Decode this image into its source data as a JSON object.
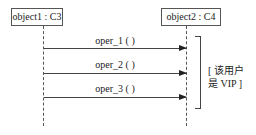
{
  "diagram": {
    "type": "sequence",
    "objects": [
      {
        "label": "object1 : C3"
      },
      {
        "label": "object2 : C4"
      }
    ],
    "messages": [
      {
        "label": "oper_1 ( )",
        "from": "object1 : C3",
        "to": "object2 : C4"
      },
      {
        "label": "oper_2 ( )",
        "from": "object1 : C3",
        "to": "object2 : C4"
      },
      {
        "label": "oper_3 ( )",
        "from": "object1 : C3",
        "to": "object2 : C4"
      }
    ],
    "guard": {
      "line1": "[ 该用户",
      "line2": "是 VIP ]"
    }
  }
}
